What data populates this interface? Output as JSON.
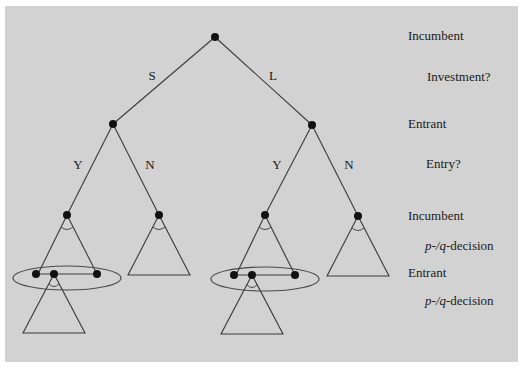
{
  "diagram": {
    "colors": {
      "panel": "#d2d2d2",
      "ink": "#1a1a1a",
      "node": "#111111"
    },
    "edge_labels": {
      "root_left": "S",
      "root_right": "L",
      "left_yes": "Y",
      "left_no": "N",
      "right_yes": "Y",
      "right_no": "N"
    },
    "stages": [
      {
        "player": "Incumbent",
        "action": "Investment?"
      },
      {
        "player": "Entrant",
        "action": "Entry?"
      },
      {
        "player": "Incumbent",
        "action_italic": "p-/q",
        "action_suffix": "-decision"
      },
      {
        "player": "Entrant",
        "action_italic": "p-/q",
        "action_suffix": "-decision"
      }
    ],
    "nodes": [
      {
        "id": "root",
        "player": "Incumbent",
        "children": [
          "S",
          "L"
        ]
      },
      {
        "id": "S",
        "player": "Entrant",
        "children": [
          "S-Y",
          "S-N"
        ]
      },
      {
        "id": "L",
        "player": "Entrant",
        "children": [
          "L-Y",
          "L-N"
        ]
      },
      {
        "id": "S-Y",
        "player": "Incumbent",
        "subtree": "p-/q-decision",
        "information_set": "Entrant"
      },
      {
        "id": "S-N",
        "player": "Incumbent",
        "subtree": "p-/q-decision"
      },
      {
        "id": "L-Y",
        "player": "Incumbent",
        "subtree": "p-/q-decision",
        "information_set": "Entrant"
      },
      {
        "id": "L-N",
        "player": "Incumbent",
        "subtree": "p-/q-decision"
      }
    ]
  }
}
